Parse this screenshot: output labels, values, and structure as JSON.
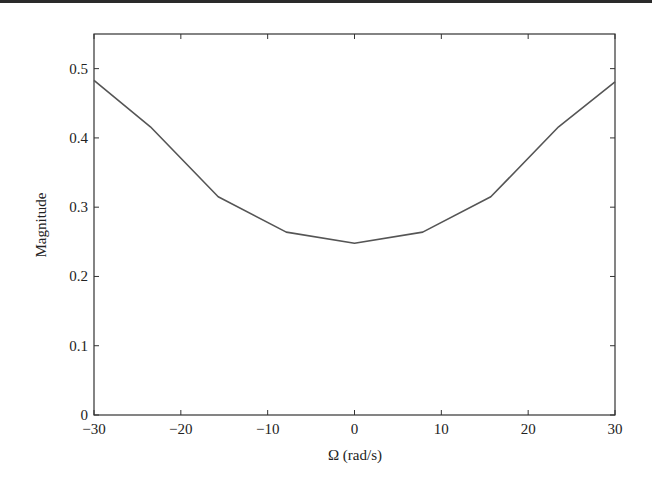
{
  "chart_data": {
    "type": "line",
    "title": "",
    "xlabel": "Ω (rad/s)",
    "ylabel": "Magnitude",
    "xlim": [
      -30,
      30
    ],
    "ylim": [
      0,
      0.55
    ],
    "grid": false,
    "legend": null,
    "xticks": [
      -30,
      -20,
      -10,
      0,
      10,
      20,
      30
    ],
    "xtick_labels": [
      "−30",
      "−20",
      "−10",
      "0",
      "10",
      "20",
      "30"
    ],
    "yticks": [
      0,
      0.1,
      0.2,
      0.3,
      0.4,
      0.5
    ],
    "ytick_labels": [
      "0",
      "0.1",
      "0.2",
      "0.3",
      "0.4",
      "0.5"
    ],
    "series": [
      {
        "name": "Magnitude",
        "color": "#555555",
        "x": [
          -30,
          -23.5,
          -15.7,
          -7.85,
          0,
          7.85,
          15.7,
          23.5,
          30
        ],
        "y": [
          0.483,
          0.416,
          0.315,
          0.264,
          0.248,
          0.264,
          0.315,
          0.416,
          0.481
        ]
      }
    ]
  },
  "layout": {
    "plot_left": 94,
    "plot_right": 615,
    "plot_top": 34,
    "plot_bottom": 415
  }
}
